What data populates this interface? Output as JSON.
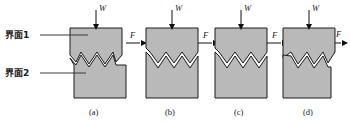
{
  "figure": {
    "title": "",
    "interface_labels": [
      {
        "id": "interface-1",
        "text": "界面1",
        "x": 6,
        "y": 38,
        "leader_from_x": 40,
        "leader_to_x": 86,
        "leader_y": 35
      },
      {
        "id": "interface-2",
        "text": "界面2",
        "x": 6,
        "y": 76,
        "leader_from_x": 40,
        "leader_to_x": 84,
        "leader_y": 73
      }
    ],
    "load_symbol": "W",
    "force_symbol": "F",
    "panels": [
      {
        "key": "a",
        "caption": "(a)",
        "origin_x": 70,
        "caption_x": 96,
        "offset": 0,
        "style": "zigzag-mated",
        "notch_depth": 6
      },
      {
        "key": "b",
        "caption": "(b)",
        "origin_x": 146,
        "caption_x": 171,
        "offset": 0,
        "style": "diamond-open",
        "notch_depth": 6
      },
      {
        "key": "c",
        "caption": "(c)",
        "origin_x": 215,
        "caption_x": 240,
        "offset": 0,
        "style": "diamond-open",
        "notch_depth": 6
      },
      {
        "key": "d",
        "caption": "(d)",
        "origin_x": 283,
        "caption_x": 308,
        "offset": 5,
        "style": "zigzag-slid",
        "notch_depth": 6
      }
    ],
    "colors": {
      "block_fill": "#b9b9b9",
      "block_stroke": "#1d1d1d",
      "leader": "#3a3a3a",
      "arrow": "#101010",
      "background": "#ffffff",
      "text": "#1a1a1a"
    },
    "geometry": {
      "block_width": 52,
      "top_block_top_y": 28,
      "interface_y": 60,
      "bottom_block_bottom_y": 98,
      "teeth": 3
    }
  }
}
